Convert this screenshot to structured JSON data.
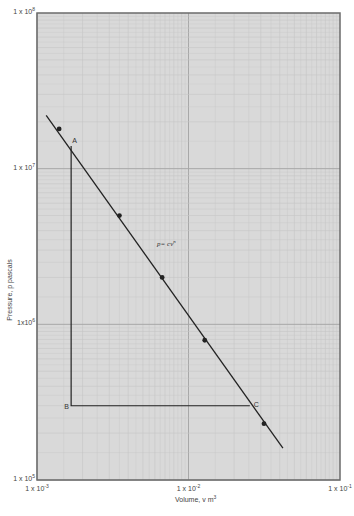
{
  "chart_data": {
    "type": "line",
    "title": "",
    "xlabel": "Volume, v m^3",
    "ylabel": "Pressure, p pascals",
    "x_scale": "log",
    "y_scale": "log",
    "xlim": [
      0.001,
      0.1
    ],
    "ylim": [
      100000,
      100000000
    ],
    "grid": true,
    "x_ticks": [
      {
        "value": 0.001,
        "mantissa": "1 x 10",
        "exp": "-3"
      },
      {
        "value": 0.01,
        "mantissa": "1 x 10",
        "exp": "-2"
      },
      {
        "value": 0.1,
        "mantissa": "1 x 10",
        "exp": "-1"
      }
    ],
    "y_ticks": [
      {
        "value": 100000,
        "mantissa": "1 x 10",
        "exp": "5"
      },
      {
        "value": 1000000,
        "mantissa": "1x10",
        "exp": "6"
      },
      {
        "value": 10000000,
        "mantissa": "1 x 10",
        "exp": "7"
      },
      {
        "value": 100000000,
        "mantissa": "1 x 10",
        "exp": "8"
      }
    ],
    "series": [
      {
        "name": "p = cv^n",
        "style": "line-with-markers",
        "line_start": {
          "x": 0.00115,
          "y": 22000000
        },
        "line_end": {
          "x": 0.042,
          "y": 160000
        },
        "points": [
          {
            "x": 0.0014,
            "y": 18000000
          },
          {
            "x": 0.0035,
            "y": 5000000
          },
          {
            "x": 0.0067,
            "y": 2000000
          },
          {
            "x": 0.0128,
            "y": 790000
          },
          {
            "x": 0.0315,
            "y": 230000
          }
        ]
      },
      {
        "name": "process A-B-C",
        "style": "line",
        "points": [
          {
            "label": "A",
            "x": 0.00168,
            "y": 14000000
          },
          {
            "label": "B",
            "x": 0.00168,
            "y": 300000
          },
          {
            "label": "C",
            "x": 0.0254,
            "y": 300000
          }
        ]
      }
    ],
    "annotations": [
      {
        "text": "p= cv",
        "sup": "n",
        "x": 0.0062,
        "y": 3200000
      },
      {
        "text": "A",
        "x": 0.00168,
        "y": 14000000
      },
      {
        "text": "B",
        "x": 0.00168,
        "y": 300000
      },
      {
        "text": "C",
        "x": 0.0254,
        "y": 300000
      }
    ]
  },
  "colors": {
    "plot_bg": "#d9d9d9",
    "minor_grid": "#c6c6c6",
    "major_grid": "#a8a8a8",
    "frame": "#6b6b6b",
    "line": "#222222"
  }
}
